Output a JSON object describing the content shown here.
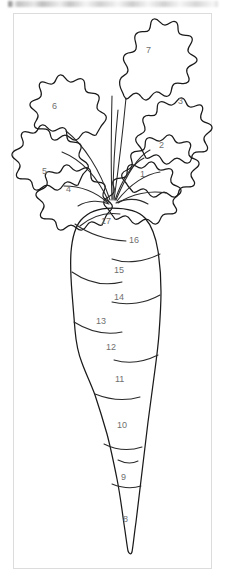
{
  "page": {
    "canvas_background": "#ffffff",
    "border_color": "#dcdcdc",
    "line_color": "#1a1a1a",
    "number_color": "#6f6f6f"
  },
  "top_strip": {
    "text": "",
    "description": "blurred cut-off gray text row"
  },
  "artwork": {
    "subject": "carrot",
    "style": "color-by-number line art outline",
    "leaf_count": 7,
    "body_segment_count": 10,
    "total_regions": 17
  },
  "regions": [
    {
      "number": "1",
      "group": "leaf",
      "x": 140,
      "y": 170
    },
    {
      "number": "2",
      "group": "leaf",
      "x": 159,
      "y": 141
    },
    {
      "number": "3",
      "group": "leaf",
      "x": 178,
      "y": 97
    },
    {
      "number": "4",
      "group": "leaf",
      "x": 66,
      "y": 185
    },
    {
      "number": "5",
      "group": "leaf",
      "x": 42,
      "y": 167
    },
    {
      "number": "6",
      "group": "leaf",
      "x": 52,
      "y": 102
    },
    {
      "number": "7",
      "group": "leaf",
      "x": 146,
      "y": 46
    },
    {
      "number": "8",
      "group": "body",
      "x": 123,
      "y": 515
    },
    {
      "number": "9",
      "group": "body",
      "x": 121,
      "y": 473
    },
    {
      "number": "10",
      "group": "body",
      "x": 117,
      "y": 421
    },
    {
      "number": "11",
      "group": "body",
      "x": 115,
      "y": 375
    },
    {
      "number": "12",
      "group": "body",
      "x": 106,
      "y": 343
    },
    {
      "number": "13",
      "group": "body",
      "x": 96,
      "y": 317
    },
    {
      "number": "14",
      "group": "body",
      "x": 114,
      "y": 293
    },
    {
      "number": "15",
      "group": "body",
      "x": 114,
      "y": 266
    },
    {
      "number": "16",
      "group": "body",
      "x": 129,
      "y": 236
    },
    {
      "number": "17",
      "group": "body",
      "x": 101,
      "y": 217
    }
  ]
}
